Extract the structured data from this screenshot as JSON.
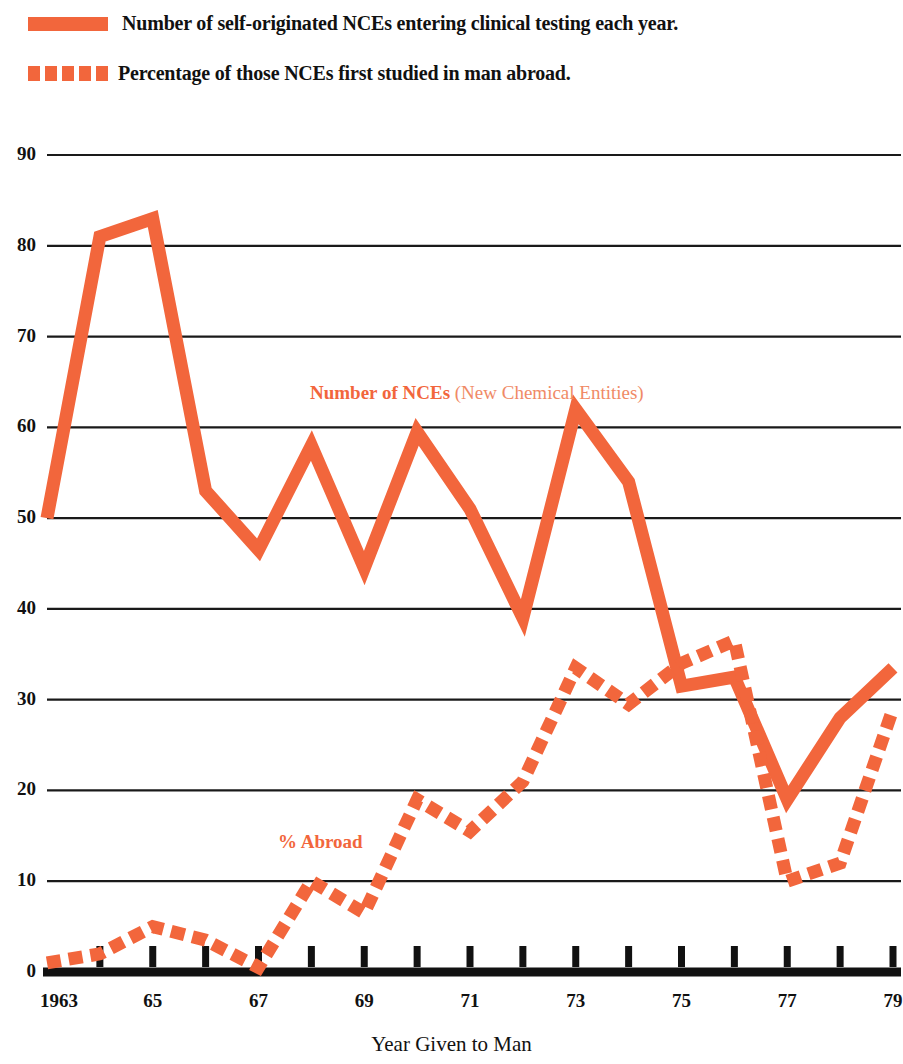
{
  "legend": {
    "items": [
      {
        "style": "solid",
        "label": "Number of self-originated NCEs entering clinical testing each year."
      },
      {
        "style": "dashed",
        "label": "Percentage of those NCEs first studied in man abroad."
      }
    ]
  },
  "annotations": {
    "nce_bold": "Number of NCEs",
    "nce_light": "(New Chemical Entities)",
    "abroad": "% Abroad"
  },
  "colors": {
    "series": "#F2663C",
    "series_light": "#F08A66",
    "axis": "#111111",
    "grid": "#1a1a1a",
    "background": "#ffffff"
  },
  "chart_data": {
    "type": "line",
    "title": "",
    "xlabel": "Year Given to Man",
    "ylabel": "",
    "xlim": [
      1963,
      1979
    ],
    "ylim": [
      0,
      90
    ],
    "ytick_step": 10,
    "grid": true,
    "legend_position": "top",
    "x": [
      1963,
      1964,
      1965,
      1966,
      1967,
      1968,
      1969,
      1970,
      1971,
      1972,
      1973,
      1974,
      1975,
      1976,
      1977,
      1978,
      1979
    ],
    "xticklabels": [
      "1963",
      "",
      "65",
      "",
      "67",
      "",
      "69",
      "",
      "71",
      "",
      "73",
      "",
      "75",
      "",
      "77",
      "",
      "79"
    ],
    "yticklabels": [
      "0",
      "10",
      "20",
      "30",
      "40",
      "50",
      "60",
      "70",
      "80",
      "90"
    ],
    "series": [
      {
        "name": "Number of NCEs",
        "style": "solid",
        "color": "#F2663C",
        "values": [
          50,
          81,
          83,
          53,
          46.5,
          58,
          44.5,
          59.5,
          51,
          39,
          62,
          54,
          31.5,
          32.5,
          19,
          28,
          33.5
        ]
      },
      {
        "name": "% Abroad",
        "style": "dashed",
        "color": "#F2663C",
        "values": [
          1,
          2,
          5,
          3.5,
          0.5,
          10,
          6.5,
          19,
          15.5,
          21,
          33.5,
          29.5,
          34,
          36.5,
          10,
          12,
          29
        ]
      }
    ]
  }
}
